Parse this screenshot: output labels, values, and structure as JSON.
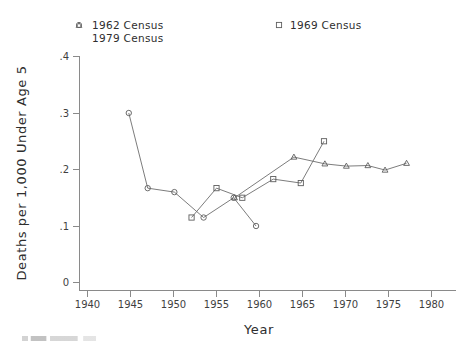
{
  "chart_data": {
    "type": "line",
    "title": "",
    "xlabel": "Year",
    "ylabel": "Deaths per 1,000 Under Age 5",
    "xlim": [
      1938,
      1982
    ],
    "ylim": [
      0,
      0.42
    ],
    "xticks": [
      1940,
      1945,
      1950,
      1955,
      1960,
      1965,
      1970,
      1975,
      1980
    ],
    "xticklabels": [
      "1940",
      "1945",
      "1950",
      "1955",
      "1960",
      "1965",
      "1970",
      "1975",
      "1980"
    ],
    "yticks": [
      0,
      0.1,
      0.2,
      0.3,
      0.4
    ],
    "yticklabels": [
      "0",
      ".1",
      ".2",
      ".3",
      ".4"
    ],
    "grid": false,
    "legend_position": "above-plot",
    "series": [
      {
        "name": "1962 Census",
        "marker": "circle",
        "x": [
          1944.8,
          1947.0,
          1950.1,
          1953.5,
          1957.0,
          1959.6
        ],
        "y": [
          0.3,
          0.167,
          0.16,
          0.115,
          0.15,
          0.1
        ]
      },
      {
        "name": "1969 Census",
        "marker": "square",
        "x": [
          1952.1,
          1955.0,
          1958.0,
          1961.6,
          1964.8,
          1967.5
        ],
        "y": [
          0.115,
          0.167,
          0.15,
          0.183,
          0.176,
          0.25
        ]
      },
      {
        "name": "1979 Census",
        "marker": "triangle",
        "x": [
          1957.1,
          1964.0,
          1967.6,
          1970.1,
          1972.6,
          1974.6,
          1977.1
        ],
        "y": [
          0.15,
          0.222,
          0.21,
          0.206,
          0.207,
          0.199,
          0.211
        ]
      }
    ]
  },
  "legend": {
    "entries": [
      {
        "label": "1962 Census",
        "marker": "circle-marker"
      },
      {
        "label": "1979 Census",
        "marker": "triangle-marker"
      },
      {
        "label": "1969 Census",
        "marker": "square-marker"
      }
    ]
  },
  "axes": {
    "x_title": "Year",
    "y_title": "Deaths per 1,000 Under Age 5"
  },
  "colors": {
    "line": "#6d6d6d",
    "marker": "#5e5e5e",
    "axis": "#8a8a8a",
    "text": "#2e2e2e",
    "background": "#ffffff"
  }
}
